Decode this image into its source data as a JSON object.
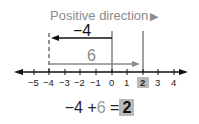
{
  "title": {
    "text": "Positive direction",
    "arrow_icon": "right-triangle"
  },
  "arrows": {
    "first": {
      "label": "−4",
      "from": 0,
      "to": -4,
      "color": "#111111"
    },
    "second": {
      "label": "6",
      "from": -4,
      "to": 2,
      "color": "#8a8a8a"
    }
  },
  "number_line": {
    "ticks": [
      "−5",
      "−4",
      "−3",
      "−2",
      "−1",
      "0",
      "1",
      "2",
      "3",
      "4"
    ],
    "highlighted": "2",
    "highlight_color": "#b9b9b9"
  },
  "equation": {
    "a": "−4",
    "op": "+",
    "b": "6",
    "eq": "=",
    "result": "2"
  }
}
